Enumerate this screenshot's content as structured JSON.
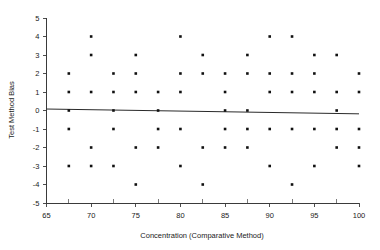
{
  "chart_data": {
    "type": "scatter",
    "title": "",
    "xlabel": "Concentration (Comparative Method)",
    "ylabel": "Test Method Bias",
    "xlim": [
      65,
      100
    ],
    "ylim": [
      -5,
      5
    ],
    "xticks": [
      65,
      70,
      75,
      80,
      85,
      90,
      95,
      100
    ],
    "xtick_labels": [
      "65",
      "70",
      "75",
      "80",
      "85",
      "90",
      "95",
      "100"
    ],
    "x_minor_tick_step": 2.5,
    "yticks": [
      -5,
      -4,
      -3,
      -2,
      -1,
      0,
      1,
      2,
      3,
      4,
      5
    ],
    "ytick_labels": [
      "-5",
      "-4",
      "-3",
      "-2",
      "-1",
      "0",
      "1",
      "2",
      "3",
      "4",
      "5"
    ],
    "grid": false,
    "legend": null,
    "marker": "square",
    "marker_color": "#111111",
    "points": [
      {
        "x": 70.0,
        "y": 4
      },
      {
        "x": 80.0,
        "y": 4
      },
      {
        "x": 90.0,
        "y": 4
      },
      {
        "x": 92.5,
        "y": 4
      },
      {
        "x": 70.0,
        "y": 3
      },
      {
        "x": 75.0,
        "y": 3
      },
      {
        "x": 82.5,
        "y": 3
      },
      {
        "x": 87.5,
        "y": 3
      },
      {
        "x": 95.0,
        "y": 3
      },
      {
        "x": 97.5,
        "y": 3
      },
      {
        "x": 67.5,
        "y": 2
      },
      {
        "x": 72.5,
        "y": 2
      },
      {
        "x": 75.0,
        "y": 2
      },
      {
        "x": 80.0,
        "y": 2
      },
      {
        "x": 82.5,
        "y": 2
      },
      {
        "x": 85.0,
        "y": 2
      },
      {
        "x": 87.5,
        "y": 2
      },
      {
        "x": 90.0,
        "y": 2
      },
      {
        "x": 92.5,
        "y": 2
      },
      {
        "x": 95.0,
        "y": 2
      },
      {
        "x": 100.0,
        "y": 2
      },
      {
        "x": 67.5,
        "y": 1
      },
      {
        "x": 70.0,
        "y": 1
      },
      {
        "x": 72.5,
        "y": 1
      },
      {
        "x": 75.0,
        "y": 1
      },
      {
        "x": 77.5,
        "y": 1
      },
      {
        "x": 80.0,
        "y": 1
      },
      {
        "x": 85.0,
        "y": 1
      },
      {
        "x": 90.0,
        "y": 1
      },
      {
        "x": 92.5,
        "y": 1
      },
      {
        "x": 95.0,
        "y": 1
      },
      {
        "x": 97.5,
        "y": 1
      },
      {
        "x": 100.0,
        "y": 1
      },
      {
        "x": 67.5,
        "y": 0
      },
      {
        "x": 72.5,
        "y": 0
      },
      {
        "x": 77.5,
        "y": 0
      },
      {
        "x": 85.0,
        "y": 0
      },
      {
        "x": 87.5,
        "y": 0
      },
      {
        "x": 97.5,
        "y": 0
      },
      {
        "x": 67.5,
        "y": -1
      },
      {
        "x": 72.5,
        "y": -1
      },
      {
        "x": 77.5,
        "y": -1
      },
      {
        "x": 80.0,
        "y": -1
      },
      {
        "x": 85.0,
        "y": -1
      },
      {
        "x": 87.5,
        "y": -1
      },
      {
        "x": 90.0,
        "y": -1
      },
      {
        "x": 92.5,
        "y": -1
      },
      {
        "x": 95.0,
        "y": -1
      },
      {
        "x": 97.5,
        "y": -1
      },
      {
        "x": 100.0,
        "y": -1
      },
      {
        "x": 70.0,
        "y": -2
      },
      {
        "x": 75.0,
        "y": -2
      },
      {
        "x": 77.5,
        "y": -2
      },
      {
        "x": 82.5,
        "y": -2
      },
      {
        "x": 85.0,
        "y": -2
      },
      {
        "x": 87.5,
        "y": -2
      },
      {
        "x": 97.5,
        "y": -2
      },
      {
        "x": 100.0,
        "y": -2
      },
      {
        "x": 67.5,
        "y": -3
      },
      {
        "x": 70.0,
        "y": -3
      },
      {
        "x": 72.5,
        "y": -3
      },
      {
        "x": 80.0,
        "y": -3
      },
      {
        "x": 90.0,
        "y": -3
      },
      {
        "x": 95.0,
        "y": -3
      },
      {
        "x": 100.0,
        "y": -3
      },
      {
        "x": 75.0,
        "y": -4
      },
      {
        "x": 82.5,
        "y": -4
      },
      {
        "x": 92.5,
        "y": -4
      }
    ],
    "fit_line": {
      "label": "regression line",
      "x_start": 65,
      "y_start": 0.08,
      "x_end": 100,
      "y_end": -0.18
    }
  }
}
